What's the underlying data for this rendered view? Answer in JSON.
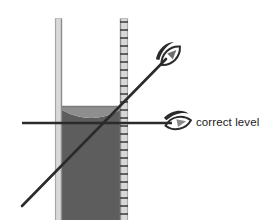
{
  "figure": {
    "title": "",
    "annotations": [
      {
        "id": "correct-level",
        "text": "correct level",
        "x": 196,
        "y": 126
      }
    ],
    "icons": [
      {
        "name": "eye-icon-tilted",
        "role": "incorrect-viewing-angle"
      },
      {
        "name": "eye-icon-level",
        "role": "correct-viewing-angle"
      }
    ],
    "colors": {
      "background": "#ffffff",
      "liquid": "#5d5d5d",
      "meniscus_highlight": "#8e8e8e",
      "glass_wall_fill": "#d8d8d8",
      "glass_wall_edge": "#9a9a9a",
      "line": "#2b2b2b",
      "tick": "#3a3a3a",
      "text": "#1a1a1a"
    },
    "cylinder": {
      "left_wall_x": 55,
      "right_wall_x": 120,
      "wall_thickness": 7,
      "top_y": 18,
      "bottom_y": 220,
      "liquid_top_y": 106,
      "graduations": 23
    },
    "sight_lines": {
      "angled": {
        "x1": 22,
        "y1": 206,
        "x2": 168,
        "y2": 57
      },
      "level": {
        "x1": 22,
        "y1": 123,
        "x2": 172,
        "y2": 123
      }
    }
  }
}
